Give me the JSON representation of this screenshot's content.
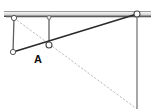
{
  "figure": {
    "width": 154,
    "height": 109,
    "background_color": "#ffffff"
  },
  "colors": {
    "rail_top_edge": "#9a9a9a",
    "rail_fill_light": "#f2f2f2",
    "rail_fill_mid": "#d8d8d8",
    "rail_bottom_edge": "#4a4a4a",
    "link_solid": "#2b2b2b",
    "link_vertical": "#6d6d6d",
    "guide_dotted": "#bdbdbd",
    "joint_stroke": "#555555",
    "joint_fill": "#ffffff",
    "label": "#111111"
  },
  "rail": {
    "name": "ground-rail",
    "x1": 4,
    "x2": 151,
    "y": 14,
    "thickness": 5
  },
  "joints": [
    {
      "id": "joint-top-left",
      "label": "",
      "x": 14,
      "y": 18,
      "r": 2.6
    },
    {
      "id": "joint-top-mid",
      "label": "",
      "x": 49,
      "y": 18,
      "r": 2.0
    },
    {
      "id": "joint-bottom-left",
      "label": "",
      "x": 13,
      "y": 52,
      "r": 2.6
    },
    {
      "id": "joint-center-a",
      "label": "A",
      "x": 49,
      "y": 45,
      "r": 3.0
    },
    {
      "id": "joint-top-right",
      "label": "",
      "x": 137,
      "y": 14,
      "r": 3.0
    }
  ],
  "links": [
    {
      "id": "link-left-vertical",
      "x1": 14,
      "y1": 18,
      "x2": 13,
      "y2": 52,
      "style": "solid",
      "width": 1.2
    },
    {
      "id": "link-mid-vertical",
      "x1": 49,
      "y1": 18,
      "x2": 49,
      "y2": 45,
      "style": "solid",
      "width": 1.2
    },
    {
      "id": "link-main-diagonal",
      "x1": 13,
      "y1": 52,
      "x2": 137,
      "y2": 14,
      "style": "solid",
      "width": 1.6
    },
    {
      "id": "link-right-vertical",
      "x1": 137,
      "y1": 14,
      "x2": 137,
      "y2": 109,
      "style": "solid",
      "width": 1.4
    }
  ],
  "guides": [
    {
      "id": "guide-diagonal-dotted",
      "x1": 14,
      "y1": 18,
      "x2": 137,
      "y2": 109,
      "style": "dotted",
      "width": 1.0
    }
  ],
  "labels": [
    {
      "id": "label-a",
      "text": "A",
      "x": 36,
      "y": 61
    }
  ]
}
